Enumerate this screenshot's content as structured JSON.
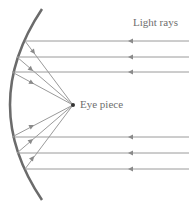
{
  "diagram": {
    "labels": {
      "light_rays": "Light rays",
      "eye_piece": "Eye piece"
    },
    "colors": {
      "mirror": "#6b6b6b",
      "rays": "#9a9a9a",
      "text": "#6e6e6e",
      "focal_point": "#333333"
    },
    "focal_point": {
      "x": 73,
      "y": 105
    },
    "rays": [
      {
        "y": 41,
        "mirror_x": 25
      },
      {
        "y": 57,
        "mirror_x": 17
      },
      {
        "y": 72,
        "mirror_x": 12
      },
      {
        "y": 137,
        "mirror_x": 12
      },
      {
        "y": 153,
        "mirror_x": 17
      },
      {
        "y": 169,
        "mirror_x": 25
      }
    ]
  }
}
